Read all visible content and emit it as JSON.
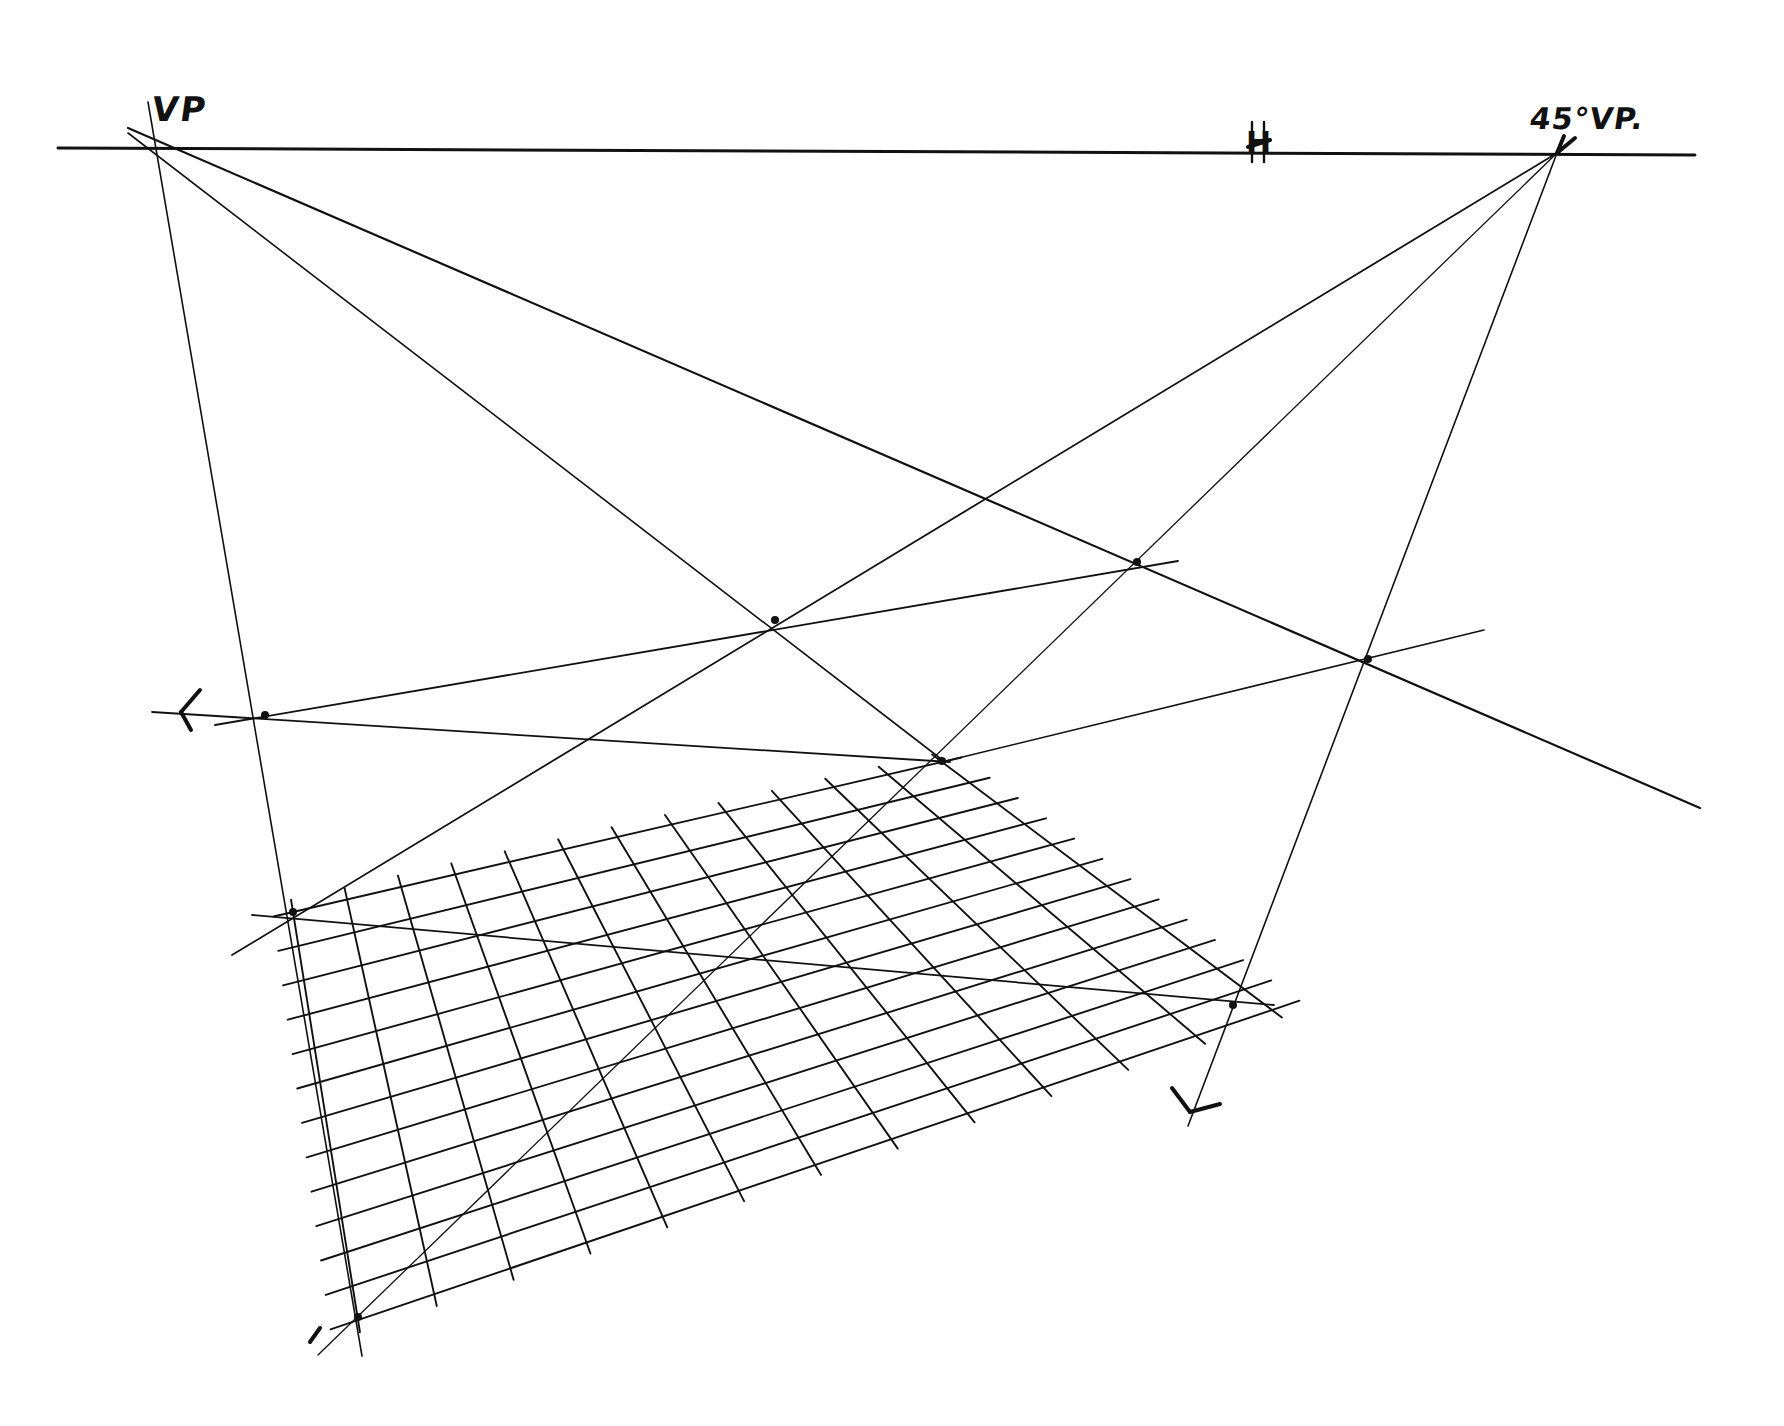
{
  "diagram": {
    "ink_color": "#111111",
    "background": "#ffffff",
    "labels": {
      "vp": "VP",
      "vp45": "45°VP.",
      "horizon_mark": "H"
    },
    "points": {
      "vp": [
        157,
        148
      ],
      "vp45": [
        1557,
        153
      ],
      "h_mark": [
        1258,
        150
      ]
    },
    "horizon_line": {
      "from": [
        58,
        148
      ],
      "to": [
        1695,
        155
      ],
      "width": 3
    },
    "construction_lines": [
      {
        "name": "vp-vertical-left-edge",
        "from": [
          148,
          102
        ],
        "to": [
          362,
          1356
        ],
        "width": 1.6
      },
      {
        "name": "vp-to-center-point",
        "from": [
          128,
          133
        ],
        "to": [
          945,
          762
        ],
        "width": 1.6
      },
      {
        "name": "vp-to-far-right",
        "from": [
          128,
          128
        ],
        "to": [
          1700,
          808
        ],
        "width": 2.2
      },
      {
        "name": "vp45-to-lower-left",
        "from": [
          1557,
          153
        ],
        "to": [
          232,
          955
        ],
        "width": 1.8
      },
      {
        "name": "vp45-diagonal-through-grid",
        "from": [
          1557,
          153
        ],
        "to": [
          318,
          1355
        ],
        "width": 1.3
      },
      {
        "name": "vp45-right-edge",
        "from": [
          1557,
          153
        ],
        "to": [
          1188,
          1126
        ],
        "width": 1.6
      },
      {
        "name": "upper-transversal",
        "from": [
          215,
          725
        ],
        "to": [
          1178,
          561
        ],
        "width": 1.8
      },
      {
        "name": "left-to-center-transversal",
        "from": [
          152,
          712
        ],
        "to": [
          950,
          762
        ],
        "width": 1.8
      },
      {
        "name": "center-to-right-transversal",
        "from": [
          942,
          762
        ],
        "to": [
          1484,
          630
        ],
        "width": 1.6
      },
      {
        "name": "grid-diagonal-transversal",
        "from": [
          252,
          915
        ],
        "to": [
          1274,
          1005
        ],
        "width": 1.8
      }
    ],
    "arrow_marks": [
      {
        "name": "left-arrow-mark",
        "segments": [
          [
            [
              181,
              712
            ],
            [
              200,
              690
            ]
          ],
          [
            [
              181,
              712
            ],
            [
              191,
              730
            ]
          ]
        ]
      },
      {
        "name": "bottom-right-arrow-mark",
        "segments": [
          [
            [
              1172,
              1088
            ],
            [
              1190,
              1112
            ]
          ],
          [
            [
              1190,
              1112
            ],
            [
              1220,
              1104
            ]
          ]
        ]
      },
      {
        "name": "vp45-arrow-mark",
        "segments": [
          [
            [
              1557,
              153
            ],
            [
              1575,
              138
            ]
          ],
          [
            [
              1557,
              153
            ],
            [
              1564,
              136
            ]
          ]
        ]
      },
      {
        "name": "bottom-left-arrow-mark",
        "segments": [
          [
            [
              320,
              1328
            ],
            [
              310,
              1342
            ]
          ]
        ]
      }
    ],
    "key_points": [
      {
        "name": "left-edge-transversal-node",
        "at": [
          265,
          715
        ]
      },
      {
        "name": "center-vanishing-node",
        "at": [
          942,
          761
        ]
      },
      {
        "name": "right-intersection-node",
        "at": [
          1368,
          659
        ]
      },
      {
        "name": "upper-right-crossing",
        "at": [
          1137,
          562
        ]
      },
      {
        "name": "upper-center-crossing",
        "at": [
          775,
          620
        ]
      },
      {
        "name": "grid-front-left-corner",
        "at": [
          293,
          912
        ]
      },
      {
        "name": "grid-front-right-corner",
        "at": [
          1233,
          1005
        ]
      },
      {
        "name": "grid-bottom-left-corner",
        "at": [
          358,
          1317
        ]
      }
    ],
    "grid": {
      "description": "Hand-drawn foreshortened floor grid",
      "rows": 12,
      "columns": 12,
      "corners": {
        "back_left": [
          293,
          912
        ],
        "back_right": [
          942,
          762
        ],
        "front_right": [
          1272,
          1010
        ],
        "front_left": [
          358,
          1320
        ]
      },
      "stroke_width": 1.9
    }
  }
}
